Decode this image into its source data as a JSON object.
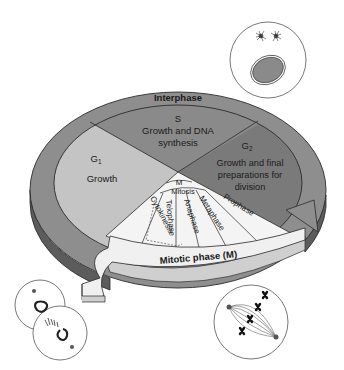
{
  "diagram": {
    "colors": {
      "ring_outer": "#8e8e8e",
      "ring_side": "#5c5c5c",
      "g1": "#c4c4c4",
      "s": "#8a8a8a",
      "g2": "#7a7a7a",
      "mitotic_fan": "#f4f4f4",
      "arrow_top": "#f0f0f0",
      "arrow_side": "#cfcfcf",
      "outline": "#2a2a2a",
      "nucleus": "#8a8a8a"
    },
    "ring_label": "Interphase",
    "phases": {
      "s": {
        "name": "S",
        "desc_line1": "Growth and DNA",
        "desc_line2": "synthesis"
      },
      "g1": {
        "name": "G",
        "sub": "1",
        "desc": "Growth"
      },
      "g2": {
        "name": "G",
        "sub": "2",
        "desc_line1": "Growth and final",
        "desc_line2": "preparations for",
        "desc_line3": "division"
      }
    },
    "mitotic": {
      "center_label": "M",
      "mitosis_label": "Mitosis",
      "stages": [
        "Cytokinesis",
        "Telophase",
        "Anaphase",
        "Metaphase",
        "Prophase"
      ],
      "arrow_label": "Mitotic phase (M)"
    },
    "illustrations": [
      {
        "name": "interphase-cell",
        "desc": "cell with centrosomes and nucleus"
      },
      {
        "name": "dividing-cells",
        "desc": "telophase/cytokinesis pair of cells"
      },
      {
        "name": "metaphase-cell",
        "desc": "spindle with aligned chromosomes"
      }
    ]
  }
}
